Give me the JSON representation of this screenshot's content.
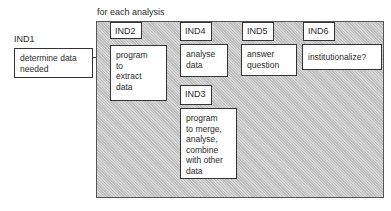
{
  "diagram": {
    "container_label": "for each analysis",
    "nodes": [
      {
        "id": "IND1",
        "label": "IND1",
        "text": "determine data needed"
      },
      {
        "id": "IND2",
        "label": "IND2",
        "text": "program to extract data"
      },
      {
        "id": "IND4",
        "label": "IND4",
        "text": "analyse data"
      },
      {
        "id": "IND5",
        "label": "IND5",
        "text": "answer question"
      },
      {
        "id": "IND6",
        "label": "IND6",
        "text": "institutionalize?"
      },
      {
        "id": "IND3",
        "label": "IND3",
        "text": "program to merge, analyse, combine with other data"
      }
    ],
    "lines": {
      "ind1_l1": "determine data",
      "ind1_l2": "needed",
      "ind2_l1": "program",
      "ind2_l2": "to",
      "ind2_l3": "extract",
      "ind2_l4": "data",
      "ind4_l1": "analyse",
      "ind4_l2": "data",
      "ind5_l1": "answer",
      "ind5_l2": "question",
      "ind6_l1": "institutionalize?",
      "ind3_l1": "program",
      "ind3_l2": "to merge,",
      "ind3_l3": "analyse,",
      "ind3_l4": "combine",
      "ind3_l5": "with other",
      "ind3_l6": "data"
    },
    "colors": {
      "container_fill": "#c9c9c9",
      "box_fill": "#ffffff",
      "border": "#333333"
    }
  }
}
